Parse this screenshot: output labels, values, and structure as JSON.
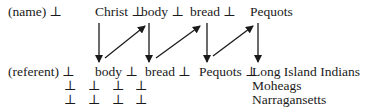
{
  "diagram": {
    "name_row": {
      "label": "(name) ⊥",
      "items": [
        "Christ ⊥",
        "body ⊥",
        "bread ⊥",
        "Pequots"
      ]
    },
    "referent_row": {
      "label": "(referent) ⊥",
      "items": [
        "body ⊥",
        "bread ⊥",
        "Pequots ⊥",
        "Long Island Indians"
      ]
    },
    "extra_rows": [
      {
        "bottoms": [
          "⊥",
          "⊥",
          "⊥",
          "⊥"
        ],
        "item": "Moheags"
      },
      {
        "bottoms": [
          "⊥",
          "⊥",
          "⊥",
          "⊥"
        ],
        "item": "Narragansetts"
      }
    ],
    "arrows": {
      "down": [
        "Christ→body",
        "body→bread",
        "bread→Pequots",
        "Pequots→Long Island Indians"
      ],
      "diagonal": [
        "body(ref)→body(name)",
        "bread(ref)→bread(name)",
        "Pequots(ref)→Pequots(name)"
      ]
    }
  }
}
